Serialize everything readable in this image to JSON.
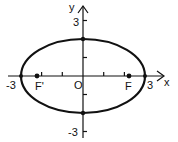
{
  "diagram": {
    "type": "ellipse-on-coordinate-axes",
    "axes": {
      "x_label": "x",
      "y_label": "y",
      "origin_label": "O",
      "x_ticks": [
        -2,
        -1,
        1,
        2
      ],
      "y_ticks": [
        -3,
        -2,
        -1,
        1,
        2,
        3
      ]
    },
    "labels": {
      "x_neg": "-3",
      "x_pos": "3",
      "y_pos": "3",
      "y_neg": "-3",
      "focus_left": "F'",
      "focus_right": "F"
    },
    "ellipse": {
      "center": [
        0,
        0
      ],
      "semi_major_x": 3,
      "semi_minor_y": 2
    },
    "points": [
      {
        "name": "F'",
        "x": -2.24,
        "y": 0
      },
      {
        "name": "F",
        "x": 2.24,
        "y": 0
      },
      {
        "name": "vertex-left",
        "x": -3,
        "y": 0
      },
      {
        "name": "vertex-right",
        "x": 3,
        "y": 0
      },
      {
        "name": "co-vertex-top",
        "x": 0,
        "y": 2
      },
      {
        "name": "co-vertex-bottom",
        "x": 0,
        "y": -2
      }
    ],
    "colors": {
      "ink": "#111111",
      "background": "#ffffff"
    }
  }
}
